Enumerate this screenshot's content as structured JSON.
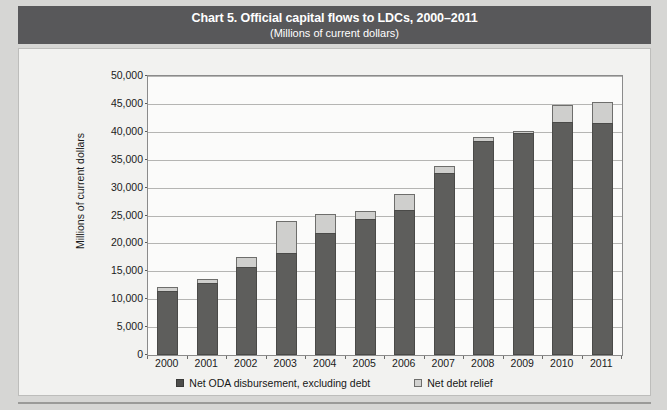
{
  "header": {
    "title": "Chart 5. Official capital flows to LDCs, 2000–2011",
    "subtitle": "(Millions of current dollars)"
  },
  "colors": {
    "banner": "#58585a",
    "banner_text": "#ffffff",
    "oda_series": "#5e5e5c",
    "debt_relief_series": "#cfcfcd",
    "page_background": "#d6d6d4",
    "card_background": "#f2f2f0",
    "gridline": "#b5b5b3"
  },
  "chart_data": {
    "type": "bar",
    "stacked": true,
    "title": "Chart 5. Official capital flows to LDCs, 2000–2011",
    "subtitle": "(Millions of current dollars)",
    "xlabel": "",
    "ylabel": "Millions of current dollars",
    "ylim": [
      0,
      50000
    ],
    "ytick_step": 5000,
    "yticks": [
      "0",
      "5,000",
      "10,000",
      "15,000",
      "20,000",
      "25,000",
      "30,000",
      "35,000",
      "40,000",
      "45,000",
      "50,000"
    ],
    "ytick_values": [
      0,
      5000,
      10000,
      15000,
      20000,
      25000,
      30000,
      35000,
      40000,
      45000,
      50000
    ],
    "grid": true,
    "legend_position": "bottom",
    "categories": [
      "2000",
      "2001",
      "2002",
      "2003",
      "2004",
      "2005",
      "2006",
      "2007",
      "2008",
      "2009",
      "2010",
      "2011"
    ],
    "series": [
      {
        "name": "Net ODA disbursement, excluding debt",
        "color": "#5e5e5c",
        "values": [
          11500,
          12900,
          15700,
          18300,
          21900,
          24400,
          25900,
          32600,
          38300,
          39700,
          41700,
          41500
        ]
      },
      {
        "name": "Net debt relief",
        "color": "#cfcfcd",
        "values": [
          700,
          700,
          1900,
          5700,
          3400,
          1400,
          3000,
          1300,
          700,
          400,
          3100,
          3900
        ]
      }
    ],
    "totals": [
      12200,
      13600,
      17600,
      24000,
      25300,
      25800,
      28900,
      33900,
      39000,
      40100,
      44800,
      45400
    ]
  },
  "legend": {
    "items": [
      {
        "label": "Net ODA disbursement, excluding debt"
      },
      {
        "label": "Net debt relief"
      }
    ]
  }
}
